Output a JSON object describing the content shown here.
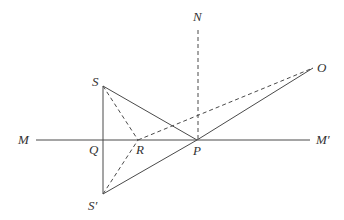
{
  "diagram": {
    "title": "",
    "points": {
      "S": {
        "label": "S",
        "x": 103,
        "y": 86
      },
      "S_prime": {
        "label": "S′",
        "x": 103,
        "y": 194
      },
      "Q": {
        "label": "Q",
        "x": 103,
        "y": 140
      },
      "R": {
        "label": "R",
        "x": 138,
        "y": 140
      },
      "P": {
        "label": "P",
        "x": 197,
        "y": 140
      },
      "O": {
        "label": "O",
        "x": 313,
        "y": 68
      },
      "N": {
        "label": "N",
        "x": 198,
        "y": 22
      },
      "M": {
        "label": "M",
        "x": 36,
        "y": 140
      },
      "M_prime": {
        "label": "M′",
        "x": 310,
        "y": 140
      }
    },
    "labels": {
      "S": "S",
      "S_prime": "S′",
      "Q": "Q",
      "R": "R",
      "P": "P",
      "O": "O",
      "N": "N",
      "M": "M",
      "M_prime": "M′"
    },
    "segments": {
      "solid": [
        [
          "M",
          "M_prime"
        ],
        [
          "S",
          "S_prime"
        ],
        [
          "S",
          "P"
        ],
        [
          "S_prime",
          "P"
        ],
        [
          "P",
          "O"
        ]
      ],
      "dashed": [
        [
          "N",
          "P"
        ],
        [
          "S",
          "R"
        ],
        [
          "S_prime",
          "R"
        ],
        [
          "R",
          "O"
        ]
      ]
    },
    "colors": {
      "line": "#4a4a4a",
      "text": "#333333",
      "background": "#ffffff"
    }
  }
}
